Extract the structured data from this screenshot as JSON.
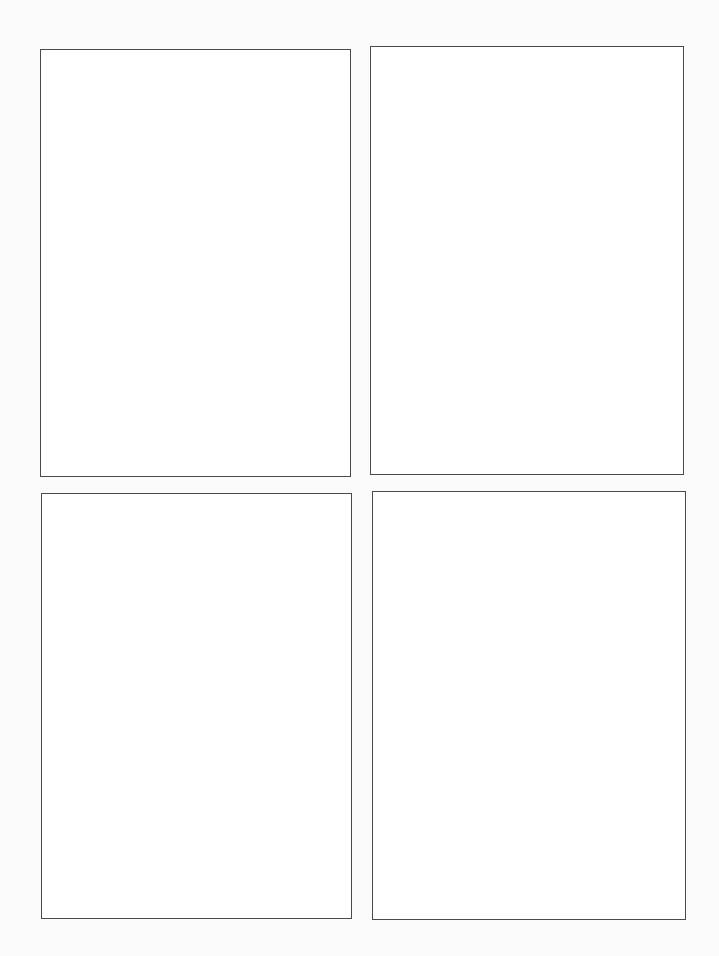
{
  "page": {
    "background": "#fbfbfb",
    "border_color": "#4a4a4a",
    "panels": [
      {
        "id": "top-left",
        "x": 40,
        "y": 49,
        "w": 311,
        "h": 428
      },
      {
        "id": "top-right",
        "x": 370,
        "y": 46,
        "w": 314,
        "h": 429
      },
      {
        "id": "bottom-left",
        "x": 41,
        "y": 493,
        "w": 311,
        "h": 426
      },
      {
        "id": "bottom-right",
        "x": 372,
        "y": 491,
        "w": 314,
        "h": 429
      }
    ]
  }
}
